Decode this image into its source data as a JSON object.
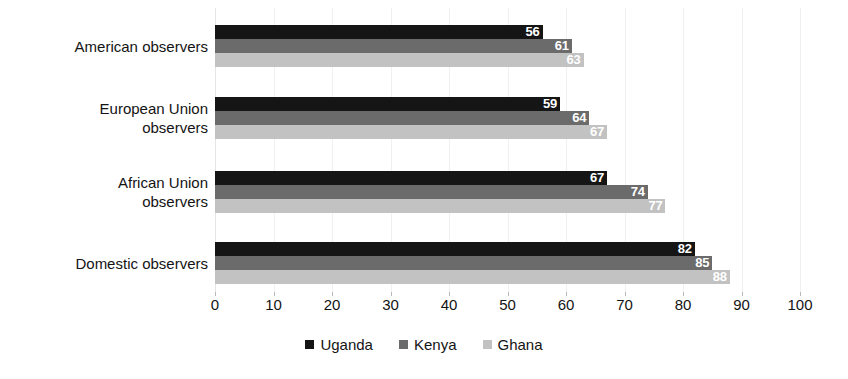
{
  "chart_data": {
    "type": "bar",
    "orientation": "horizontal",
    "title": "",
    "xlabel": "",
    "ylabel": "",
    "xlim": [
      0,
      100
    ],
    "grid": true,
    "legend_position": "bottom",
    "categories": [
      "American observers",
      "European Union\nobservers",
      "African Union\nobservers",
      "Domestic observers"
    ],
    "tick_labels": [
      "0",
      "10",
      "20",
      "30",
      "40",
      "50",
      "60",
      "70",
      "80",
      "90",
      "100"
    ],
    "tick_values": [
      0,
      10,
      20,
      30,
      40,
      50,
      60,
      70,
      80,
      90,
      100
    ],
    "series": [
      {
        "name": "Uganda",
        "color": "#151515",
        "values": [
          56,
          59,
          67,
          82
        ],
        "labels": [
          "56",
          "59",
          "67",
          "82"
        ]
      },
      {
        "name": "Kenya",
        "color": "#6b6b6b",
        "values": [
          61,
          64,
          74,
          85
        ],
        "labels": [
          "61",
          "64",
          "74",
          "85"
        ]
      },
      {
        "name": "Ghana",
        "color": "#c2c2c2",
        "values": [
          63,
          67,
          77,
          88
        ],
        "labels": [
          "63",
          "67",
          "77",
          "88"
        ]
      }
    ]
  },
  "legend": {
    "items": [
      {
        "label": "Uganda",
        "color": "#151515"
      },
      {
        "label": "Kenya",
        "color": "#6b6b6b"
      },
      {
        "label": "Ghana",
        "color": "#c2c2c2"
      }
    ]
  }
}
